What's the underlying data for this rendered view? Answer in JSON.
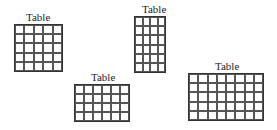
{
  "diagram": {
    "tables": [
      {
        "label": "Table",
        "cols": 5,
        "rows": 5,
        "x": 14,
        "y": 24,
        "width": 49,
        "height": 48,
        "label_x": 26,
        "label_y": 12
      },
      {
        "label": "Table",
        "cols": 4,
        "rows": 6,
        "x": 134,
        "y": 16,
        "width": 32,
        "height": 57,
        "label_x": 142,
        "label_y": 4
      },
      {
        "label": "Table",
        "cols": 6,
        "rows": 4,
        "x": 74,
        "y": 84,
        "width": 56,
        "height": 38,
        "label_x": 91,
        "label_y": 72
      },
      {
        "label": "Table",
        "cols": 8,
        "rows": 5,
        "x": 188,
        "y": 73,
        "width": 76,
        "height": 48,
        "label_x": 215,
        "label_y": 61
      }
    ],
    "colors": {
      "grid_line": "#555555",
      "label_text": "#222222",
      "background": "#ffffff"
    }
  }
}
